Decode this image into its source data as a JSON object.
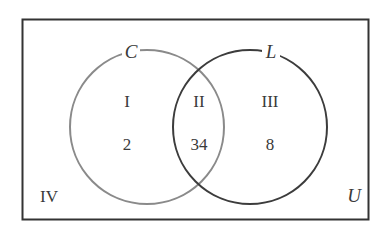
{
  "diagram": {
    "type": "venn",
    "universe": {
      "label": "U",
      "stroke": "#333333"
    },
    "sets": [
      {
        "name": "C",
        "stroke": "#8a8a8a"
      },
      {
        "name": "L",
        "stroke": "#3c3c3c"
      }
    ],
    "regions": [
      {
        "roman": "I",
        "value": "2",
        "description": "C only"
      },
      {
        "roman": "II",
        "value": "34",
        "description": "C and L"
      },
      {
        "roman": "III",
        "value": "8",
        "description": "L only"
      },
      {
        "roman": "IV",
        "value": "",
        "description": "outside C and L"
      }
    ]
  }
}
